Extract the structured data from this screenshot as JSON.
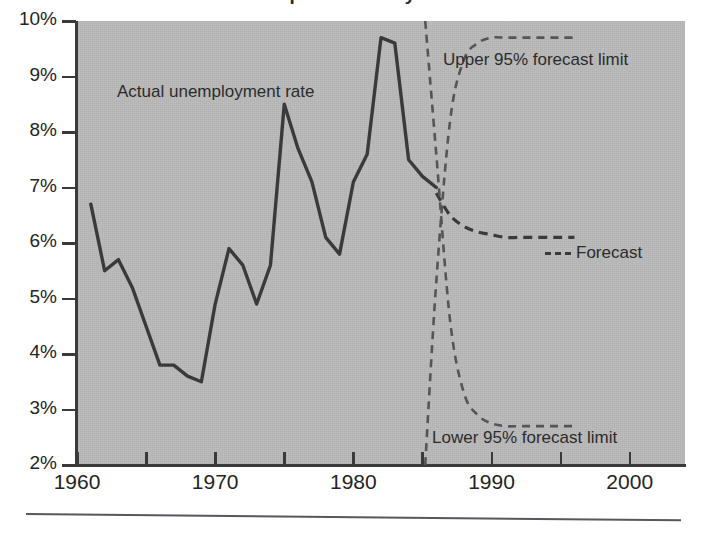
{
  "caption": {
    "partial_text": "...ipate future cycle and in..."
  },
  "chart_data": {
    "type": "line",
    "title": "",
    "xlabel": "",
    "ylabel": "",
    "xlim": [
      1960,
      2004
    ],
    "ylim": [
      2,
      10
    ],
    "grid": false,
    "legend_position": "inline-annotations",
    "x_ticks": [
      1960,
      1970,
      1980,
      1990,
      2000
    ],
    "x_minor_ticks": [
      1965,
      1975,
      1985,
      1995
    ],
    "y_ticks": [
      "2%",
      "3%",
      "4%",
      "5%",
      "6%",
      "7%",
      "8%",
      "9%",
      "10%"
    ],
    "y_tick_values": [
      2,
      3,
      4,
      5,
      6,
      7,
      8,
      9,
      10
    ],
    "series": [
      {
        "name": "Actual unemployment rate",
        "style": "solid",
        "color": "#3a3a3a",
        "x": [
          1961,
          1962,
          1963,
          1964,
          1965,
          1966,
          1967,
          1968,
          1969,
          1970,
          1971,
          1972,
          1973,
          1974,
          1975,
          1976,
          1977,
          1978,
          1979,
          1980,
          1981,
          1982,
          1983,
          1984,
          1985,
          1986
        ],
        "values": [
          6.7,
          5.5,
          5.7,
          5.2,
          4.5,
          3.8,
          3.8,
          3.6,
          3.5,
          4.9,
          5.9,
          5.6,
          4.9,
          5.6,
          8.5,
          7.7,
          7.1,
          6.1,
          5.8,
          7.1,
          7.6,
          9.7,
          9.6,
          7.5,
          7.2,
          7.0
        ]
      },
      {
        "name": "Forecast",
        "style": "dashed",
        "color": "#3a3a3a",
        "x": [
          1986,
          1987,
          1988,
          1989,
          1990,
          1991,
          1992,
          1993,
          1994,
          1995,
          1996
        ],
        "values": [
          6.9,
          6.5,
          6.3,
          6.2,
          6.15,
          6.1,
          6.1,
          6.1,
          6.1,
          6.1,
          6.1
        ]
      },
      {
        "name": "Upper 95% forecast limit",
        "style": "dashed",
        "color": "#555555",
        "x": [
          1985.2,
          1986,
          1987,
          1988,
          1989,
          1990,
          1991,
          1992,
          1993,
          1994,
          1995,
          1996
        ],
        "values": [
          2.0,
          5.3,
          8.2,
          9.3,
          9.6,
          9.7,
          9.7,
          9.7,
          9.7,
          9.7,
          9.7,
          9.7
        ]
      },
      {
        "name": "Lower 95% forecast limit",
        "style": "dashed",
        "color": "#555555",
        "x": [
          1985.2,
          1986,
          1987,
          1988,
          1989,
          1990,
          1991,
          1992,
          1993,
          1994,
          1995,
          1996
        ],
        "values": [
          10.0,
          7.6,
          4.6,
          3.3,
          2.9,
          2.75,
          2.7,
          2.7,
          2.7,
          2.7,
          2.7,
          2.7
        ]
      }
    ],
    "annotations": [
      {
        "id": "actual",
        "text": "Actual unemployment rate"
      },
      {
        "id": "upper",
        "text": "Upper 95% forecast limit"
      },
      {
        "id": "lower",
        "text": "Lower 95% forecast limit"
      },
      {
        "id": "forecast",
        "text": "Forecast"
      }
    ]
  },
  "colors": {
    "plot_background": "#b9b9b9",
    "axis": "#3a3a3a",
    "line": "#3a3a3a",
    "page_background": "#ffffff",
    "rule": "#55585c"
  }
}
